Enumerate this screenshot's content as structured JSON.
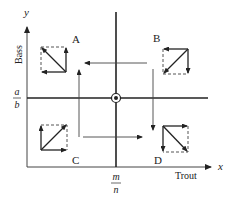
{
  "diagram": {
    "type": "phase-plane",
    "axes": {
      "x": {
        "symbol": "x",
        "label": "Trout",
        "equilibrium_label": {
          "numerator": "m",
          "denominator": "n"
        }
      },
      "y": {
        "symbol": "y",
        "label": "Bass",
        "equilibrium_label": {
          "numerator": "a",
          "denominator": "b"
        }
      }
    },
    "equilibrium_point": "circled-dot",
    "regions": [
      {
        "id": "A",
        "label": "A",
        "position": "upper-left",
        "vector": "up-left",
        "components": [
          "left",
          "up"
        ]
      },
      {
        "id": "B",
        "label": "B",
        "position": "upper-right",
        "vector": "down-left",
        "components": [
          "left",
          "down"
        ]
      },
      {
        "id": "C",
        "label": "C",
        "position": "lower-left",
        "vector": "up-right",
        "components": [
          "right",
          "up"
        ]
      },
      {
        "id": "D",
        "label": "D",
        "position": "lower-right",
        "vector": "down-right",
        "components": [
          "right",
          "down"
        ]
      }
    ],
    "flow_arrows": [
      {
        "from": "B",
        "to": "A",
        "direction": "left"
      },
      {
        "from": "A",
        "to": "C",
        "direction": "down-implied",
        "note": "vertical arrow pointing up in left side"
      },
      {
        "from": "C",
        "to": "D",
        "direction": "right"
      },
      {
        "from": "B",
        "to": "D",
        "direction": "down"
      }
    ],
    "colors": {
      "line": "#222222",
      "dashed": "#555555",
      "background": "#ffffff"
    }
  }
}
